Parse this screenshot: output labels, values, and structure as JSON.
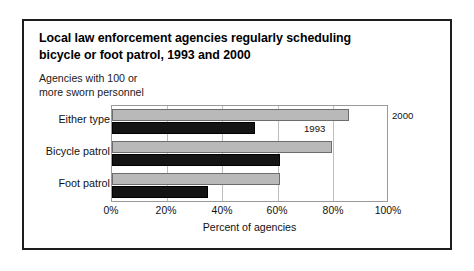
{
  "figure": {
    "title": "Local law enforcement agencies regularly scheduling bicycle or foot patrol, 1993 and 2000",
    "title_line1": "Local law enforcement agencies regularly scheduling",
    "title_line2": "bicycle or foot patrol, 1993 and 2000",
    "subtitle_line1": "Agencies with 100 or",
    "subtitle_line2": "more sworn personnel",
    "border_color": "#1d1d1d",
    "background_color": "#ffffff"
  },
  "annotations": {
    "series_2000_note": "2000",
    "series_1993_note": "1993"
  },
  "chart_data": {
    "type": "bar",
    "orientation": "horizontal",
    "title": "Local law enforcement agencies regularly scheduling bicycle or foot patrol, 1993 and 2000",
    "subtitle": "Agencies with 100 or more sworn personnel",
    "xlabel": "Percent of agencies",
    "ylabel": "",
    "categories": [
      "Either type",
      "Bicycle patrol",
      "Foot patrol"
    ],
    "series": [
      {
        "name": "2000",
        "color": "#b9b9b9",
        "values": [
          86,
          80,
          61
        ]
      },
      {
        "name": "1993",
        "color": "#141414",
        "values": [
          52,
          61,
          35
        ]
      }
    ],
    "xlim": [
      0,
      100
    ],
    "xticks": [
      0,
      20,
      40,
      60,
      80,
      100
    ],
    "xtick_labels": [
      "0%",
      "20%",
      "40%",
      "60%",
      "80%",
      "100%"
    ],
    "grid": true,
    "grid_axis": "x",
    "legend": "inline-annotation"
  }
}
